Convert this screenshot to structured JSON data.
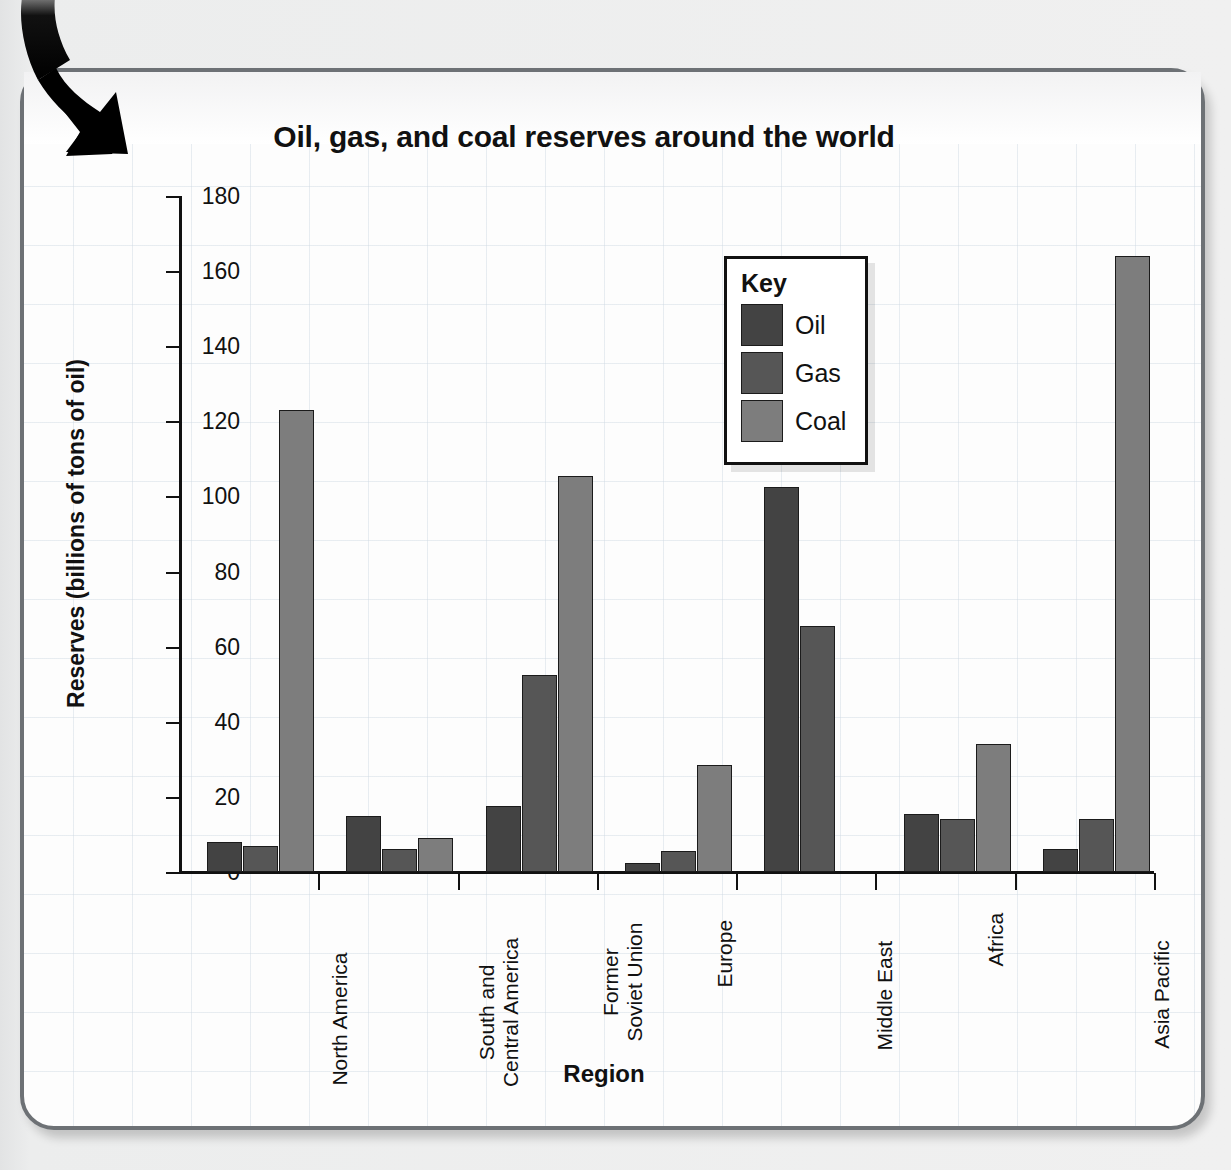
{
  "chart_data": {
    "type": "bar",
    "title": "Oil, gas, and coal reserves around the world",
    "xlabel": "Region",
    "ylabel": "Reserves (billions of tons of oil)",
    "ylim": [
      0,
      180
    ],
    "yticks": [
      0,
      20,
      40,
      60,
      80,
      100,
      120,
      140,
      160,
      180
    ],
    "grid": true,
    "legend_title": "Key",
    "legend_position": "inside-top-right",
    "categories": [
      "North America",
      "South and Central America",
      "Former Soviet Union",
      "Europe",
      "Middle East",
      "Africa",
      "Asia Pacific"
    ],
    "category_lines": [
      [
        "North America"
      ],
      [
        "South and",
        "Central America"
      ],
      [
        "Former",
        "Soviet Union"
      ],
      [
        "Europe"
      ],
      [
        "Middle East"
      ],
      [
        "Africa"
      ],
      [
        "Asia Pacific"
      ]
    ],
    "series": [
      {
        "name": "Oil",
        "color": "#434343",
        "values": [
          8,
          15,
          17.5,
          2.5,
          102.5,
          15.5,
          6
        ]
      },
      {
        "name": "Gas",
        "color": "#565656",
        "values": [
          7,
          6,
          52.5,
          5.5,
          65.5,
          14,
          14
        ]
      },
      {
        "name": "Coal",
        "color": "#7d7d7d",
        "values": [
          123,
          9,
          105.5,
          28.5,
          0,
          34,
          164
        ]
      }
    ]
  },
  "decor": {
    "arrow_name": "curved-down-arrow"
  }
}
